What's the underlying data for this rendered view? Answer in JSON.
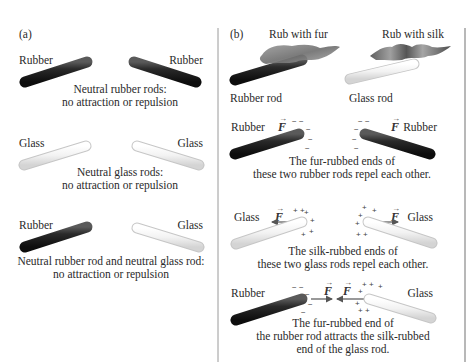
{
  "panel_a": {
    "label": "(a)",
    "row1": {
      "left_label": "Rubber",
      "right_label": "Rubber",
      "caption": [
        "Neutral rubber rods:",
        "no attraction or repulsion"
      ]
    },
    "row2": {
      "left_label": "Glass",
      "right_label": "Glass",
      "caption": [
        "Neutral glass rods:",
        "no attraction or repulsion"
      ]
    },
    "row3": {
      "left_label": "Rubber",
      "right_label": "Glass",
      "caption": [
        "Neutral rubber rod and neutral glass rod:",
        "no attraction or repulsion"
      ]
    }
  },
  "panel_b": {
    "label": "(b)",
    "rub_fur": "Rub with fur",
    "rub_silk": "Rub with silk",
    "rubber_rod": "Rubber rod",
    "glass_rod": "Glass rod",
    "row1": {
      "left_label": "Rubber",
      "right_label": "Rubber",
      "force": "F",
      "caption": [
        "The fur-rubbed ends of",
        "these two rubber rods repel each other."
      ]
    },
    "row2": {
      "left_label": "Glass",
      "right_label": "Glass",
      "force": "F",
      "caption": [
        "The silk-rubbed ends of",
        "these two glass rods repel each other."
      ]
    },
    "row3": {
      "left_label": "Rubber",
      "right_label": "Glass",
      "force": "F",
      "caption": [
        "The fur-rubbed end of",
        "the rubber rod attracts the silk-rubbed",
        "end of the glass rod."
      ]
    },
    "charges": {
      "negative": "−",
      "positive": "+"
    }
  },
  "colors": {
    "rubber": "#1c1c1c",
    "glass": "#eeeeee",
    "divider": "#9a9a9a",
    "arrow": "#555555"
  }
}
